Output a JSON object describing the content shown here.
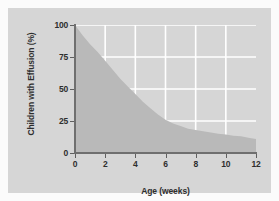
{
  "chart_data": {
    "type": "area",
    "title": "",
    "xlabel": "Age (weeks)",
    "ylabel": "Children with Effusion (%)",
    "xlim": [
      0,
      12
    ],
    "ylim": [
      0,
      100
    ],
    "xticks": [
      "0",
      "2",
      "4",
      "6",
      "8",
      "10",
      "12"
    ],
    "yticks": [
      "0",
      "25",
      "50",
      "75",
      "100"
    ],
    "grid": "white horizontal gridlines at 25/50/75 and vertical gridlines at 2/4/6/8/10",
    "legend": "none",
    "series": [
      {
        "name": "Children with Effusion (%)",
        "x": [
          0,
          0.5,
          1,
          1.5,
          2,
          2.5,
          3,
          3.5,
          4,
          4.5,
          5,
          5.5,
          6,
          6.5,
          7,
          7.5,
          8,
          8.5,
          9,
          9.5,
          10,
          10.5,
          11,
          11.5,
          12
        ],
        "values": [
          100,
          92,
          85,
          79,
          72,
          65,
          58,
          52,
          46,
          40,
          35,
          30,
          26,
          23,
          21,
          19,
          18,
          17,
          16,
          15,
          14.5,
          13.5,
          13,
          12,
          11
        ]
      }
    ],
    "colors": {
      "area_fill": "#b9b9b9",
      "panel_background": "#d6d6d6",
      "gridlines": "#ffffff",
      "axis": "#6f6f6f",
      "text": "#2e2e2e",
      "page_background": "#fbfbfb"
    }
  }
}
